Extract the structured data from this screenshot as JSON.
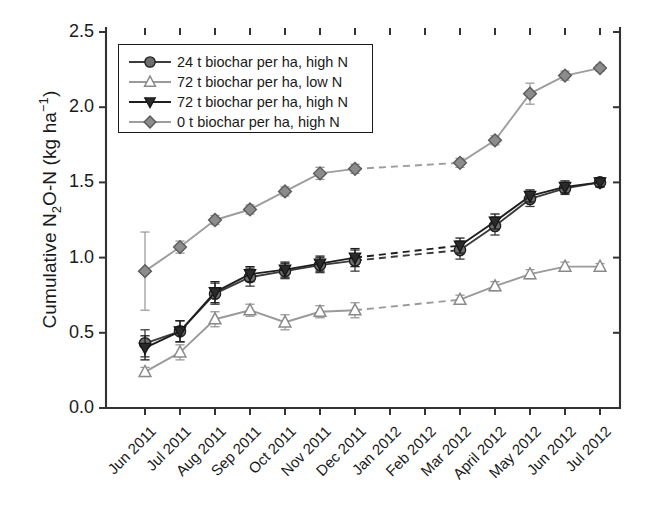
{
  "figure": {
    "width": 651,
    "height": 523,
    "background": "#ffffff"
  },
  "axes": {
    "y_title_parts": {
      "pre": "Cumulative N",
      "sub1": "2",
      "mid": "O-N (kg ha",
      "sup1": "−1",
      "post": ")"
    },
    "y_title_plain": "Cumulative N2O-N (kg ha-1)",
    "y_ticks": [
      "0.0",
      "0.5",
      "1.0",
      "1.5",
      "2.0",
      "2.5"
    ],
    "y_tick_values": [
      0.0,
      0.5,
      1.0,
      1.5,
      2.0,
      2.5
    ],
    "ylim": [
      0.0,
      2.5
    ],
    "x_title": "",
    "x_ticks": [
      "Jun 2011",
      "Jul 2011",
      "Aug 2011",
      "Sep 2011",
      "Oct 2011",
      "Nov 2011",
      "Dec 2011",
      "Jan 2012",
      "Feb 2012",
      "Mar 2012",
      "April 2012",
      "May 2012",
      "Jun 2012",
      "Jul 2012"
    ],
    "grid": false,
    "tick_direction": "out",
    "axis_color": "#333333",
    "frame": "left-bottom"
  },
  "legend": {
    "position": "upper-left-inside",
    "border_color": "#1a1a1a",
    "entries": [
      {
        "label": "24 t biochar per ha, high N",
        "marker": "circle-filled",
        "marker_face": "#6e6e6e",
        "marker_edge": "#1f1f1f",
        "line_color": "#3b3b3b",
        "series_key": "biochar_24_highN"
      },
      {
        "label": "72 t biochar per ha, low N",
        "marker": "triangle-up-open",
        "marker_face": "#ffffff",
        "marker_edge": "#8a8a8a",
        "line_color": "#9a9a9a",
        "series_key": "biochar_72_lowN"
      },
      {
        "label": "72 t biochar per ha, high N",
        "marker": "triangle-down-filled",
        "marker_face": "#2a2a2a",
        "marker_edge": "#161616",
        "line_color": "#1e1e1e",
        "series_key": "biochar_72_highN"
      },
      {
        "label": "0 t biochar per ha, high N",
        "marker": "diamond-filled",
        "marker_face": "#8c8c8c",
        "marker_edge": "#5a5a5a",
        "line_color": "#9d9d9d",
        "series_key": "biochar_0_highN"
      }
    ]
  },
  "chart_data": {
    "type": "line",
    "title": "",
    "xlabel": "",
    "ylabel": "Cumulative N2O-N (kg ha-1)",
    "ylim": [
      0.0,
      2.5
    ],
    "grid": false,
    "legend_position": "upper left",
    "categories": [
      "Jun 2011",
      "Jul 2011",
      "Aug 2011",
      "Sep 2011",
      "Oct 2011",
      "Nov 2011",
      "Dec 2011",
      "Jan 2012",
      "Feb 2012",
      "Mar 2012",
      "April 2012",
      "May 2012",
      "Jun 2012",
      "Jul 2012"
    ],
    "note": "No measurements taken in Jan 2012 and Feb 2012; dashed segments bridge Dec 2011 to Mar 2012.",
    "series": [
      {
        "name": "24 t biochar per ha, high N",
        "key": "biochar_24_highN",
        "marker": "circle-filled",
        "color": "#3b3b3b",
        "values": [
          0.43,
          0.51,
          0.76,
          0.87,
          0.91,
          0.95,
          0.98,
          null,
          null,
          1.05,
          1.21,
          1.39,
          1.46,
          1.5
        ],
        "errors": [
          0.09,
          0.07,
          0.07,
          0.06,
          0.05,
          0.05,
          0.07,
          null,
          null,
          0.06,
          0.06,
          0.05,
          0.04,
          0.03
        ]
      },
      {
        "name": "72 t biochar per ha, low N",
        "key": "biochar_72_lowN",
        "marker": "triangle-up-open",
        "color": "#9a9a9a",
        "values": [
          0.24,
          0.37,
          0.59,
          0.65,
          0.57,
          0.64,
          0.65,
          null,
          null,
          0.72,
          0.81,
          0.89,
          0.94,
          0.94
        ],
        "errors": [
          0.03,
          0.05,
          0.05,
          0.04,
          0.05,
          0.04,
          0.05,
          null,
          null,
          0.03,
          0.03,
          0.03,
          0.03,
          0.02
        ]
      },
      {
        "name": "72 t biochar per ha, high N",
        "key": "biochar_72_highN",
        "marker": "triangle-down-filled",
        "color": "#1e1e1e",
        "values": [
          0.4,
          0.51,
          0.77,
          0.89,
          0.92,
          0.96,
          1.0,
          null,
          null,
          1.08,
          1.24,
          1.41,
          1.47,
          1.5
        ],
        "errors": [
          0.08,
          0.07,
          0.07,
          0.05,
          0.05,
          0.05,
          0.06,
          null,
          null,
          0.05,
          0.05,
          0.04,
          0.04,
          0.03
        ]
      },
      {
        "name": "0 t biochar per ha, high N",
        "key": "biochar_0_highN",
        "marker": "diamond-filled",
        "color": "#9d9d9d",
        "values": [
          0.91,
          1.07,
          1.25,
          1.32,
          1.44,
          1.56,
          1.59,
          null,
          null,
          1.63,
          1.78,
          2.09,
          2.21,
          2.26
        ],
        "errors": [
          0.26,
          0.04,
          0.03,
          0.03,
          0.03,
          0.04,
          0.03,
          null,
          null,
          0.03,
          0.03,
          0.07,
          0.03,
          0.02
        ]
      }
    ]
  }
}
